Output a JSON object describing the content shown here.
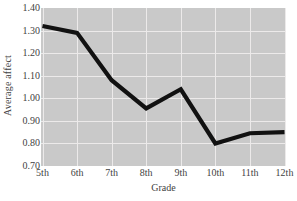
{
  "chart_data": {
    "type": "line",
    "title": "",
    "xlabel": "Grade",
    "ylabel": "Average affect",
    "categories": [
      "5th",
      "6th",
      "7th",
      "8th",
      "9th",
      "10th",
      "11th",
      "12th"
    ],
    "values": [
      1.32,
      1.29,
      1.08,
      0.955,
      1.04,
      0.8,
      0.845,
      0.85
    ],
    "series": [
      {
        "name": "Average affect",
        "values": [
          1.32,
          1.29,
          1.08,
          0.955,
          1.04,
          0.8,
          0.845,
          0.85
        ]
      }
    ],
    "ylim": [
      0.7,
      1.4
    ],
    "ytick_labels": [
      "1.40",
      "1.30",
      "1.20",
      "1.10",
      "1.00",
      "0.90",
      "0.80",
      "0.70"
    ],
    "ytick_values": [
      1.4,
      1.3,
      1.2,
      1.1,
      1.0,
      0.9,
      0.8,
      0.7
    ],
    "grid": true,
    "legend": "none",
    "line_color": "#111111",
    "plot_background": "#c9c9c9",
    "grid_color": "#eceaea",
    "figure_background": "#ffffff"
  }
}
